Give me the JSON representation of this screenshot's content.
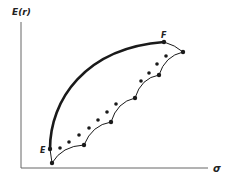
{
  "figure": {
    "y_axis_label": "E(r)",
    "x_axis_label": "σ",
    "point_labels": {
      "E": "E",
      "F": "F"
    },
    "colors": {
      "ink": "#1a1a1a",
      "axis": "#666666"
    }
  },
  "geometry": {
    "axes": {
      "origin": [
        21,
        168
      ],
      "y_top": [
        21,
        22
      ],
      "x_right": [
        208,
        168
      ]
    },
    "efficient_frontier": {
      "from": [
        50,
        149
      ],
      "to": [
        164,
        42
      ]
    },
    "frontier_tail": {
      "from": [
        164,
        42
      ],
      "to": [
        183,
        52
      ]
    },
    "scallop_vertices": [
      [
        52,
        163
      ],
      [
        84,
        145
      ],
      [
        111,
        122
      ],
      [
        135,
        98
      ],
      [
        159,
        75
      ],
      [
        183,
        52
      ]
    ],
    "dots": [
      [
        60,
        148
      ],
      [
        69,
        142
      ],
      [
        79,
        135
      ],
      [
        89,
        128
      ],
      [
        98,
        120
      ],
      [
        107,
        112
      ],
      [
        116,
        104
      ],
      [
        141,
        81
      ],
      [
        149,
        73
      ],
      [
        157,
        64
      ],
      [
        166,
        56
      ]
    ]
  }
}
